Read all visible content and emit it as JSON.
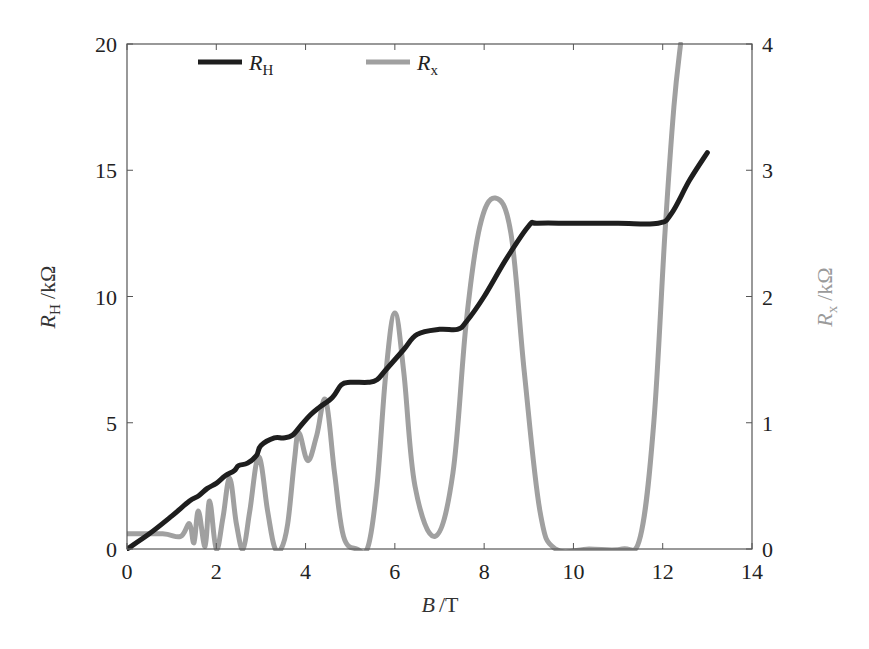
{
  "chart_data": {
    "type": "line",
    "title": "",
    "xlabel": "B /T",
    "xlabel_parts": {
      "var": "B",
      "unit": "/T"
    },
    "ylabel_left": "R_H /kΩ",
    "ylabel_left_parts": {
      "var": "R",
      "sub": "H",
      "unit": "/kΩ"
    },
    "ylabel_right": "R_x /kΩ",
    "ylabel_right_parts": {
      "var": "R",
      "sub": "x",
      "unit": "/kΩ"
    },
    "xlim": [
      0,
      14
    ],
    "ylim_left": [
      0,
      20
    ],
    "ylim_right": [
      0,
      4
    ],
    "xticks": [
      0,
      2,
      4,
      6,
      8,
      10,
      12,
      14
    ],
    "xtick_labels": [
      "0",
      "2",
      "4",
      "6",
      "8",
      "10",
      "12",
      "14"
    ],
    "yticks_left": [
      0,
      5,
      10,
      15,
      20
    ],
    "ytick_labels_left": [
      "0",
      "5",
      "10",
      "15",
      "20"
    ],
    "yticks_right": [
      0,
      1,
      2,
      3,
      4
    ],
    "ytick_labels_right": [
      "0",
      "1",
      "2",
      "3",
      "4"
    ],
    "grid": false,
    "legend_position": "top-inside",
    "legend": [
      {
        "name": "R_H",
        "var": "R",
        "sub": "H",
        "color": "#1e1e1e"
      },
      {
        "name": "R_x",
        "var": "R",
        "sub": "x",
        "color": "#a0a0a0"
      }
    ],
    "series": [
      {
        "name": "R_H",
        "axis": "left",
        "color": "#1e1e1e",
        "x": [
          0.0,
          0.5,
          1.0,
          1.4,
          1.6,
          1.8,
          2.0,
          2.2,
          2.4,
          2.5,
          2.7,
          2.9,
          3.0,
          3.3,
          3.5,
          3.7,
          3.9,
          4.1,
          4.3,
          4.6,
          4.8,
          5.0,
          5.4,
          5.6,
          5.8,
          6.2,
          6.5,
          7.0,
          7.4,
          7.6,
          8.0,
          8.5,
          9.0,
          9.2,
          10.0,
          11.0,
          11.9,
          12.2,
          12.6,
          13.0
        ],
        "y": [
          0.0,
          0.6,
          1.3,
          1.9,
          2.1,
          2.4,
          2.6,
          2.9,
          3.1,
          3.3,
          3.4,
          3.7,
          4.1,
          4.4,
          4.4,
          4.5,
          4.9,
          5.3,
          5.6,
          6.0,
          6.5,
          6.6,
          6.6,
          6.7,
          7.1,
          7.9,
          8.5,
          8.7,
          8.7,
          9.0,
          10.0,
          11.5,
          12.8,
          12.9,
          12.9,
          12.9,
          12.9,
          13.3,
          14.6,
          15.7
        ]
      },
      {
        "name": "R_x",
        "axis": "right",
        "color": "#a0a0a0",
        "peaks_B": [
          1.4,
          1.6,
          1.85,
          2.3,
          2.95,
          3.85,
          4.45,
          6.0,
          8.25,
          12.4
        ],
        "peaks_Rx": [
          0.2,
          0.3,
          0.38,
          0.56,
          0.73,
          0.92,
          1.18,
          1.87,
          2.78,
          4.0
        ],
        "minima_B": [
          2.0,
          2.6,
          3.45,
          4.05,
          5.15,
          6.9,
          10.35
        ],
        "minima_Rx": [
          0.0,
          0.0,
          0.0,
          0.7,
          0.0,
          0.1,
          0.0
        ],
        "x": [
          0.0,
          0.8,
          1.2,
          1.4,
          1.5,
          1.6,
          1.75,
          1.85,
          2.0,
          2.15,
          2.3,
          2.45,
          2.6,
          2.75,
          2.95,
          3.15,
          3.3,
          3.45,
          3.6,
          3.75,
          3.85,
          4.05,
          4.25,
          4.45,
          4.65,
          4.85,
          5.15,
          5.4,
          5.6,
          5.8,
          6.0,
          6.2,
          6.45,
          6.9,
          7.3,
          7.6,
          7.9,
          8.25,
          8.6,
          8.9,
          9.25,
          9.6,
          10.35,
          11.1,
          11.5,
          11.8,
          12.05,
          12.25,
          12.4
        ],
        "y": [
          0.12,
          0.12,
          0.1,
          0.2,
          0.05,
          0.3,
          0.02,
          0.38,
          0.0,
          0.25,
          0.56,
          0.2,
          0.0,
          0.3,
          0.73,
          0.3,
          0.02,
          0.0,
          0.2,
          0.7,
          0.92,
          0.7,
          0.9,
          1.18,
          0.6,
          0.1,
          0.0,
          0.02,
          0.5,
          1.4,
          1.87,
          1.4,
          0.5,
          0.1,
          0.6,
          1.8,
          2.55,
          2.78,
          2.5,
          1.4,
          0.3,
          0.0,
          0.0,
          0.0,
          0.1,
          1.0,
          2.5,
          3.5,
          4.0
        ]
      }
    ]
  }
}
